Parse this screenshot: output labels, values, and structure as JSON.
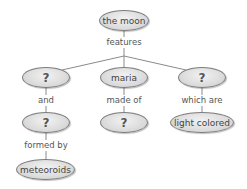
{
  "diagram": {
    "type": "concept-map",
    "root": {
      "label": "the moon"
    },
    "root_link": "features",
    "branches": [
      {
        "node": "?",
        "link": "and",
        "child": "?",
        "child_link": "formed by",
        "grandchild": "meteoroids"
      },
      {
        "node": "maria",
        "link": "made of",
        "child": "?"
      },
      {
        "node": "?",
        "link": "which are",
        "child": "light colored"
      }
    ]
  },
  "colors": {
    "node_fill": "#dcdcdc",
    "node_border": "#7d7d7d",
    "line": "#888888",
    "text": "#444444"
  }
}
